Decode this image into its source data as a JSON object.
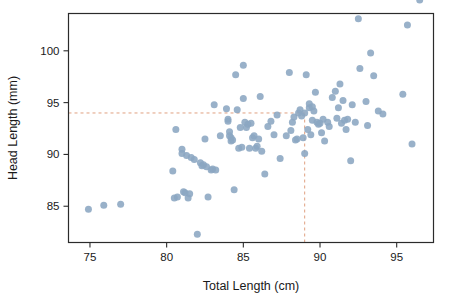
{
  "chart_data": {
    "type": "scatter",
    "title": "",
    "xlabel": "Total Length (cm)",
    "ylabel": "Head Length (mm)",
    "xlim": [
      73.6,
      97.4
    ],
    "ylim": [
      81.5,
      103.6
    ],
    "xticks": [
      75,
      80,
      85,
      90,
      95
    ],
    "xtick_labels": [
      "75",
      "80",
      "85",
      "90",
      "95"
    ],
    "yticks": [
      85,
      90,
      95,
      100
    ],
    "ytick_labels": [
      "85",
      "90",
      "95",
      "100"
    ],
    "grid": false,
    "legend": null,
    "marker_color": "#8ba6c1",
    "reference_line_color": "#e0a080",
    "annotations": [
      {
        "name": "vertical-reference-line",
        "type": "vline",
        "x": 89.0,
        "style": "dashed",
        "from_y": 81.5,
        "to_y": 94.0
      },
      {
        "name": "horizontal-reference-line",
        "type": "hline",
        "y": 94.0,
        "style": "dashed",
        "from_x": 73.6,
        "to_x": 89.0
      }
    ],
    "x": [
      74.9,
      75.9,
      77.0,
      80.4,
      80.5,
      80.6,
      80.7,
      81.0,
      81.0,
      81.1,
      81.2,
      81.3,
      81.4,
      81.5,
      81.6,
      81.8,
      82.0,
      82.2,
      82.3,
      82.4,
      82.5,
      82.6,
      82.7,
      82.9,
      83.0,
      83.1,
      83.2,
      83.5,
      83.9,
      84.0,
      84.0,
      84.1,
      84.1,
      84.2,
      84.2,
      84.3,
      84.4,
      84.5,
      84.6,
      84.7,
      84.8,
      84.9,
      85.0,
      85.0,
      85.1,
      85.2,
      85.3,
      85.4,
      85.5,
      85.6,
      85.7,
      85.8,
      85.9,
      86.0,
      86.1,
      86.2,
      86.4,
      86.6,
      86.8,
      87.0,
      87.2,
      87.4,
      87.8,
      88.0,
      88.1,
      88.2,
      88.3,
      88.4,
      88.5,
      88.6,
      88.7,
      88.8,
      88.9,
      89.0,
      89.0,
      89.1,
      89.2,
      89.3,
      89.3,
      89.4,
      89.5,
      89.5,
      89.6,
      89.7,
      89.8,
      89.9,
      90.0,
      90.1,
      90.2,
      90.3,
      90.5,
      90.6,
      90.8,
      91.0,
      91.1,
      91.2,
      91.3,
      91.4,
      91.5,
      91.6,
      91.7,
      91.8,
      92.0,
      92.1,
      92.3,
      92.5,
      92.6,
      93.0,
      93.1,
      93.3,
      93.5,
      93.8,
      94.1,
      95.4,
      95.7,
      96.0,
      96.5
    ],
    "y": [
      84.7,
      85.1,
      85.2,
      88.4,
      85.8,
      92.4,
      85.9,
      90.5,
      90.1,
      86.4,
      86.3,
      89.9,
      85.8,
      86.2,
      89.7,
      89.5,
      82.3,
      89.2,
      88.9,
      89.0,
      91.5,
      88.8,
      85.9,
      88.5,
      88.6,
      94.8,
      88.5,
      91.8,
      94.4,
      93.4,
      93.2,
      92.2,
      91.8,
      91.6,
      91.3,
      91.4,
      86.6,
      97.7,
      94.3,
      90.6,
      92.6,
      90.7,
      98.6,
      95.4,
      93.1,
      92.6,
      92.9,
      90.6,
      93.0,
      91.6,
      91.8,
      90.6,
      90.8,
      91.5,
      95.6,
      90.3,
      88.1,
      92.7,
      93.2,
      91.9,
      93.8,
      89.6,
      91.8,
      97.9,
      92.3,
      93.1,
      93.6,
      91.4,
      91.5,
      94.0,
      94.3,
      93.7,
      91.6,
      94.0,
      90.1,
      97.7,
      92.4,
      94.5,
      94.9,
      91.9,
      94.6,
      93.3,
      94.2,
      96.0,
      93.1,
      92.9,
      93.0,
      92.1,
      93.4,
      91.3,
      93.1,
      92.7,
      95.5,
      96.1,
      93.5,
      94.5,
      96.8,
      93.0,
      95.2,
      93.3,
      92.4,
      93.4,
      89.4,
      94.8,
      93.1,
      103.1,
      98.3,
      95.1,
      92.8,
      99.8,
      97.6,
      94.2,
      93.9,
      95.8,
      102.5,
      91.0
    ]
  },
  "axis": {
    "xlabel": "Total Length (cm)",
    "ylabel": "Head Length (mm)"
  }
}
